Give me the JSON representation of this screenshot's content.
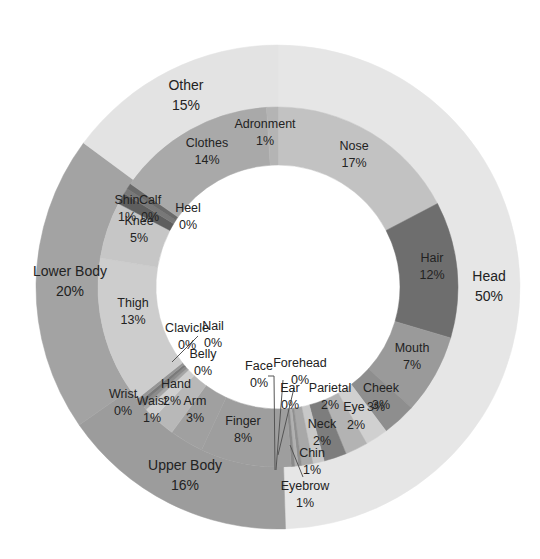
{
  "chart_data": {
    "type": "donut",
    "title": "",
    "start_angle_deg": 0,
    "direction": "clockwise",
    "outer_ring": {
      "name": "Category",
      "slices": [
        {
          "label": "Head",
          "value": 50,
          "display": "50%",
          "color": "#e6e6e6"
        },
        {
          "label": "Upper Body",
          "value": 16,
          "display": "16%",
          "color": "#9c9c9c"
        },
        {
          "label": "Lower Body",
          "value": 20,
          "display": "20%",
          "color": "#a3a3a3"
        },
        {
          "label": "Other",
          "value": 15,
          "display": "15%",
          "color": "#e3e3e3"
        }
      ]
    },
    "inner_ring": {
      "name": "Body part",
      "slices": [
        {
          "label": "Nose",
          "value": 17,
          "display": "17%",
          "parent": "Head",
          "color": "#c2c2c2"
        },
        {
          "label": "Hair",
          "value": 12,
          "display": "12%",
          "parent": "Head",
          "color": "#6e6e6e"
        },
        {
          "label": "Mouth",
          "value": 7,
          "display": "7%",
          "parent": "Head",
          "color": "#9a9a9a"
        },
        {
          "label": "Cheek",
          "value": 3,
          "display": "3%",
          "parent": "Head",
          "color": "#8e8e8e"
        },
        {
          "label": "Eye",
          "value": 2,
          "display": "2%",
          "parent": "Head",
          "color": "#d0d0d0"
        },
        {
          "label": "Parietal",
          "value": 2,
          "display": "2%",
          "parent": "Head",
          "color": "#b3b3b3"
        },
        {
          "label": "Neck",
          "value": 2,
          "display": "2%",
          "parent": "Head",
          "color": "#7d7d7d"
        },
        {
          "label": "Chin",
          "value": 1,
          "display": "1%",
          "parent": "Head",
          "color": "#c8c8c8"
        },
        {
          "label": "Eyebrow",
          "value": 1,
          "display": "1%",
          "parent": "Head",
          "color": "#a8a8a8"
        },
        {
          "label": "Ear",
          "value": 0.3,
          "display": "0%",
          "parent": "Head",
          "color": "#909090"
        },
        {
          "label": "Forehead",
          "value": 0.3,
          "display": "0%",
          "parent": "Head",
          "color": "#b0b0b0"
        },
        {
          "label": "Face",
          "value": 0.3,
          "display": "0%",
          "parent": "Head",
          "color": "#8a8a8a"
        },
        {
          "label": "Finger",
          "value": 8,
          "display": "8%",
          "parent": "Upper Body",
          "color": "#9e9e9e"
        },
        {
          "label": "Arm",
          "value": 3,
          "display": "3%",
          "parent": "Upper Body",
          "color": "#a0a0a0"
        },
        {
          "label": "Hand",
          "value": 2,
          "display": "2%",
          "parent": "Upper Body",
          "color": "#b8b8b8"
        },
        {
          "label": "Waist",
          "value": 1,
          "display": "1%",
          "parent": "Upper Body",
          "color": "#cfcfcf"
        },
        {
          "label": "Wrist",
          "value": 0.3,
          "display": "0%",
          "parent": "Upper Body",
          "color": "#a5a5a5"
        },
        {
          "label": "Belly",
          "value": 0.3,
          "display": "0%",
          "parent": "Upper Body",
          "color": "#8c8c8c"
        },
        {
          "label": "Nail",
          "value": 0.3,
          "display": "0%",
          "parent": "Upper Body",
          "color": "#7a7a7a"
        },
        {
          "label": "Clavicle",
          "value": 0.3,
          "display": "0%",
          "parent": "Upper Body",
          "color": "#969696"
        },
        {
          "label": "Thigh",
          "value": 13,
          "display": "13%",
          "parent": "Lower Body",
          "color": "#cdcdcd"
        },
        {
          "label": "Knee",
          "value": 5,
          "display": "5%",
          "parent": "Lower Body",
          "color": "#c6c6c6"
        },
        {
          "label": "Shin",
          "value": 1,
          "display": "1%",
          "parent": "Lower Body",
          "color": "#5e5e5e"
        },
        {
          "label": "Calf",
          "value": 0.5,
          "display": "0%",
          "parent": "Lower Body",
          "color": "#787878"
        },
        {
          "label": "Heel",
          "value": 0.5,
          "display": "0%",
          "parent": "Lower Body",
          "color": "#6a6a6a"
        },
        {
          "label": "Clothes",
          "value": 14,
          "display": "14%",
          "parent": "Other",
          "color": "#a9a9a9"
        },
        {
          "label": "Adronment",
          "value": 1,
          "display": "1%",
          "parent": "Other",
          "color": "#b4b4b4"
        }
      ]
    },
    "legend": "none (data labels on slices)"
  },
  "labels": {
    "outer": [
      {
        "name": "Head",
        "pct": "50%",
        "x": 489,
        "y": 281
      },
      {
        "name": "Upper Body",
        "pct": "16%",
        "x": 185,
        "y": 470
      },
      {
        "name": "Lower Body",
        "pct": "20%",
        "x": 70,
        "y": 276
      },
      {
        "name": "Other",
        "pct": "15%",
        "x": 186,
        "y": 90
      }
    ],
    "inner": [
      {
        "name": "Nose",
        "pct": "17%",
        "x": 354,
        "y": 150
      },
      {
        "name": "Hair",
        "pct": "12%",
        "x": 432,
        "y": 262
      },
      {
        "name": "Mouth",
        "pct": "7%",
        "x": 412,
        "y": 352
      },
      {
        "name": "Cheek",
        "pct": "3%",
        "x": 381,
        "y": 392
      },
      {
        "name": "Eye",
        "pct": "",
        "x": 354,
        "y": 411
      },
      {
        "name": "",
        "pct": "3%",
        "x": 376,
        "y": 411
      },
      {
        "name": "",
        "pct": "2%",
        "x": 356,
        "y": 429
      },
      {
        "name": "Parietal",
        "pct": "2%",
        "x": 330,
        "y": 392
      },
      {
        "name": "Neck",
        "pct": "2%",
        "x": 322,
        "y": 428
      },
      {
        "name": "Chin",
        "pct": "1%",
        "x": 312,
        "y": 457
      },
      {
        "name": "Eyebrow",
        "pct": "1%",
        "x": 305,
        "y": 490
      },
      {
        "name": "Ear",
        "pct": "0%",
        "x": 290,
        "y": 392
      },
      {
        "name": "Forehead",
        "pct": "0%",
        "x": 300,
        "y": 367
      },
      {
        "name": "Face",
        "pct": "0%",
        "x": 259,
        "y": 370
      },
      {
        "name": "Finger",
        "pct": "8%",
        "x": 243,
        "y": 425
      },
      {
        "name": "Arm",
        "pct": "3%",
        "x": 195,
        "y": 405
      },
      {
        "name": "Hand",
        "pct": "",
        "x": 176,
        "y": 388
      },
      {
        "name": "",
        "pct": "2%",
        "x": 172,
        "y": 405
      },
      {
        "name": "Waist",
        "pct": "1%",
        "x": 152,
        "y": 405
      },
      {
        "name": "Wrist",
        "pct": "0%",
        "x": 123,
        "y": 398
      },
      {
        "name": "Belly",
        "pct": "0%",
        "x": 203,
        "y": 358
      },
      {
        "name": "Nail",
        "pct": "0%",
        "x": 213,
        "y": 330
      },
      {
        "name": "Clavicle",
        "pct": "0%",
        "x": 187,
        "y": 332
      },
      {
        "name": "Thigh",
        "pct": "13%",
        "x": 133,
        "y": 307
      },
      {
        "name": "Knee",
        "pct": "5%",
        "x": 139,
        "y": 225
      },
      {
        "name": "Shin",
        "pct": "1%",
        "x": 127,
        "y": 204
      },
      {
        "name": "Calf",
        "pct": "0%",
        "x": 150,
        "y": 204
      },
      {
        "name": "Heel",
        "pct": "0%",
        "x": 188,
        "y": 212
      },
      {
        "name": "Clothes",
        "pct": "14%",
        "x": 207,
        "y": 147
      },
      {
        "name": "Adronment",
        "pct": "1%",
        "x": 265,
        "y": 128
      }
    ]
  }
}
